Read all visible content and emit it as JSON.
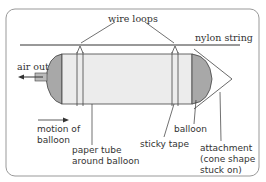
{
  "diagram": {
    "labels": {
      "wire_loops": "wire loops",
      "nylon_string": "nylon string",
      "air_out": "air out",
      "motion_line1": "motion of",
      "motion_line2": "balloon",
      "paper_tube_line1": "paper tube",
      "paper_tube_line2": "around balloon",
      "sticky_tape": "sticky tape",
      "balloon": "balloon",
      "attachment_line1": "attachment",
      "attachment_line2": "(cone shape",
      "attachment_line3": "stuck on)"
    },
    "colors": {
      "border": "#999999",
      "tube_fill": "#ececec",
      "balloon_fill": "#a8a8a8",
      "line": "#333333"
    }
  }
}
